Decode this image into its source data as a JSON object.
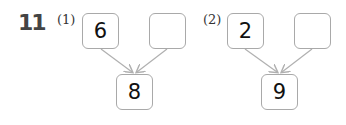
{
  "question_number": "11",
  "problems": [
    {
      "label": "(1)",
      "left_value": "6",
      "right_value": "",
      "total": "8"
    },
    {
      "label": "(2)",
      "left_value": "2",
      "right_value": "",
      "total": "9"
    }
  ],
  "colors": {
    "box_border": "#a9a9a9",
    "arrow": "#b0b0b0",
    "text": "#111111"
  }
}
